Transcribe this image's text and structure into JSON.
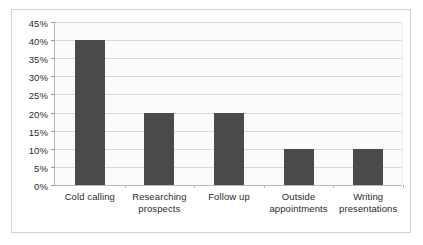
{
  "chart_data": {
    "type": "bar",
    "title": "",
    "subtitle": "",
    "xlabel": "",
    "ylabel": "",
    "categories": [
      "Cold calling",
      "Researching prospects",
      "Follow up",
      "Outside appointments",
      "Writing presentations"
    ],
    "values": [
      40,
      20,
      20,
      10,
      10
    ],
    "value_suffix": "%",
    "ylim": [
      0,
      45
    ],
    "ytick_step": 5,
    "ytick_labels": [
      "0%",
      "5%",
      "10%",
      "15%",
      "20%",
      "25%",
      "30%",
      "35%",
      "40%",
      "45%"
    ],
    "ytick_values": [
      0,
      5,
      10,
      15,
      20,
      25,
      30,
      35,
      40,
      45
    ],
    "grid": true,
    "legend": false,
    "legend_position": "none",
    "annotations": [],
    "colors": {
      "bar_fill": "#4a4a4a",
      "plot_background": "#fbfbfb",
      "gridline": "#d8d8d8",
      "axis_line": "#b9b9b9",
      "frame_border": "#d2d2d2",
      "text": "#2b2b2b",
      "page_background": "#ffffff"
    }
  }
}
